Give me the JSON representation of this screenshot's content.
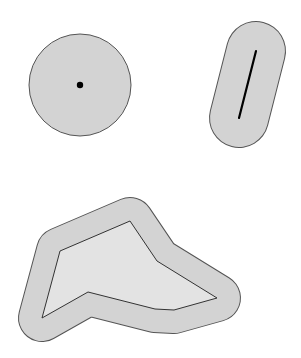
{
  "diagram": {
    "colors": {
      "buffer_fill": "#d3d3d3",
      "inner_fill": "#e3e3e3",
      "outline": "#555555",
      "feature": "#000000",
      "background": "#ffffff"
    },
    "shapes": [
      {
        "name": "point-buffer",
        "feature": "point"
      },
      {
        "name": "line-buffer",
        "feature": "line"
      },
      {
        "name": "polygon-buffer",
        "feature": "polygon"
      }
    ]
  }
}
